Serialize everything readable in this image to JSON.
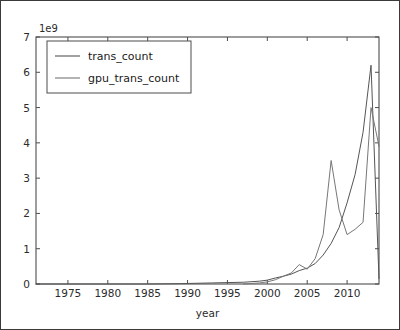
{
  "figure": {
    "background_color": "#ffffff",
    "border_color": "#3a3a3a",
    "axis_color": "#4d4d4d"
  },
  "chart_data": {
    "type": "line",
    "title": "",
    "xlabel": "year",
    "ylabel": "",
    "y_offset_text": "1e9",
    "y_offset_multiplier": 1000000000,
    "xlim": [
      1971,
      2014
    ],
    "ylim": [
      0,
      7
    ],
    "xticks": [
      1975,
      1980,
      1985,
      1990,
      1995,
      2000,
      2005,
      2010
    ],
    "xticklabels": [
      "1975",
      "1980",
      "1985",
      "1990",
      "1995",
      "2000",
      "2005",
      "2010"
    ],
    "yticks": [
      0,
      1,
      2,
      3,
      4,
      5,
      6,
      7
    ],
    "yticklabels": [
      "0",
      "1",
      "2",
      "3",
      "4",
      "5",
      "6",
      "7"
    ],
    "grid": false,
    "legend_position": "upper left",
    "series": [
      {
        "name": "trans_count",
        "color": "#555555",
        "x": [
          1971,
          1974,
          1978,
          1982,
          1985,
          1989,
          1993,
          1997,
          1999,
          2000,
          2001,
          2002,
          2003,
          2004,
          2005,
          2006,
          2007,
          2008,
          2009,
          2010,
          2011,
          2012,
          2013,
          2014
        ],
        "y": [
          0.0,
          0.0,
          0.0,
          0.0,
          0.0,
          0.01,
          0.03,
          0.05,
          0.08,
          0.11,
          0.17,
          0.22,
          0.28,
          0.38,
          0.45,
          0.58,
          0.82,
          1.15,
          1.6,
          2.3,
          3.1,
          4.3,
          6.2,
          0.15
        ]
      },
      {
        "name": "gpu_trans_count",
        "color": "#777777",
        "x": [
          1997,
          1999,
          2000,
          2001,
          2002,
          2003,
          2004,
          2005,
          2006,
          2007,
          2008,
          2009,
          2010,
          2011,
          2012,
          2013,
          2014
        ],
        "y": [
          0.0,
          0.03,
          0.06,
          0.12,
          0.22,
          0.31,
          0.55,
          0.42,
          0.72,
          1.4,
          3.5,
          2.1,
          1.4,
          1.55,
          1.75,
          5.0,
          3.9
        ]
      }
    ]
  },
  "legend": {
    "entries": [
      {
        "label": "trans_count",
        "color": "#555555"
      },
      {
        "label": "gpu_trans_count",
        "color": "#777777"
      }
    ]
  }
}
